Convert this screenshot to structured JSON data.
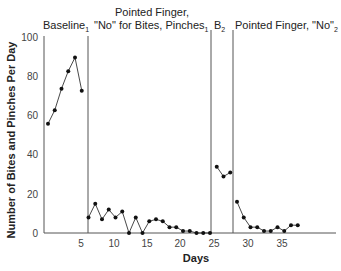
{
  "chart_data": {
    "type": "line",
    "title": "",
    "xlabel": "Days",
    "ylabel": "Number of Bites and Pinches Per Day",
    "ylim": [
      0,
      100
    ],
    "yticks": [
      0,
      20,
      40,
      60,
      80,
      100
    ],
    "xticks": [
      5,
      10,
      15,
      20,
      25,
      30,
      35
    ],
    "grid": false,
    "legend": "none",
    "phases": [
      {
        "label_line1": "",
        "label_line2": "Baseline",
        "subscript": "1",
        "days": [
          1,
          2,
          3,
          4,
          5,
          6
        ],
        "values": [
          56,
          63,
          74,
          83,
          90,
          73
        ]
      },
      {
        "label_line1": "Pointed Finger,",
        "label_line2": "\"No\" for Bites, Pinches",
        "subscript": "1",
        "days": [
          7,
          8,
          9,
          10,
          11,
          12,
          13,
          14,
          15,
          16,
          17,
          18,
          19,
          20,
          21,
          22,
          23,
          24,
          25
        ],
        "values": [
          8,
          15,
          7,
          12,
          8,
          11,
          0,
          8,
          0,
          6,
          7,
          6,
          3,
          3,
          1,
          1,
          0,
          0,
          0
        ]
      },
      {
        "label_line1": "",
        "label_line2": "B",
        "subscript": "2",
        "days": [
          26,
          27,
          28
        ],
        "values": [
          34,
          29,
          31
        ]
      },
      {
        "label_line1": "",
        "label_line2": "Pointed Finger, \"No\"",
        "subscript": "2",
        "days": [
          29,
          30,
          31,
          32,
          33,
          34,
          35,
          36,
          37,
          38
        ],
        "values": [
          16,
          8,
          3,
          3,
          1,
          1,
          3,
          1,
          4,
          4
        ]
      }
    ]
  },
  "labels": {
    "xlabel": "Days",
    "ylabel": "Number of Bites and Pinches Per Day",
    "yticks": [
      "0",
      "20",
      "40",
      "60",
      "80",
      "100"
    ],
    "xticks": [
      "5",
      "10",
      "15",
      "20",
      "25",
      "30",
      "35"
    ],
    "phase1": "Baseline",
    "phase1_sub": "1",
    "phase2_line1": "Pointed Finger,",
    "phase2_line2": "\"No\" for Bites, Pinches",
    "phase2_sub": "1",
    "phase3": "B",
    "phase3_sub": "2",
    "phase4": "Pointed Finger, \"No\"",
    "phase4_sub": "2"
  }
}
